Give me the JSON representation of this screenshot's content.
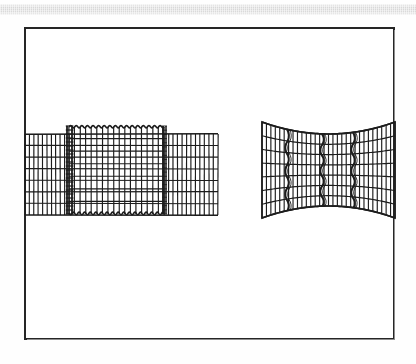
{
  "page": {
    "background_color": "#ffffff",
    "scan_band": {
      "name": "scan-artifact-band",
      "color": "#d4d4d4",
      "x": 0,
      "y": 4,
      "width": 416,
      "height": 11
    },
    "frame": {
      "name": "figure-border",
      "color": "#262626",
      "x": 24,
      "y": 27,
      "width": 371,
      "height": 313,
      "stroke_width": 2
    }
  },
  "figure": {
    "type": "finite-element-mesh-diagram",
    "panel_count": 2,
    "ink_color": "#1c1c1c",
    "caption": "",
    "panels": [
      {
        "name": "left-mesh-undeformed-with-inclusion",
        "label": "",
        "x": 25,
        "y": 126,
        "width": 193,
        "height": 92,
        "description": "Rectangular finite element mesh with an embedded rectangular inclusion bounded by a serrated/scalloped interface and a dense transition strip of small elements on its left edge.",
        "outer_mesh": {
          "left": 25,
          "right": 218,
          "top": 134,
          "bottom": 215,
          "columns": 34,
          "rows": 7
        },
        "inclusion": {
          "left": 69,
          "right": 164,
          "top": 126,
          "bottom": 214,
          "columns": 17,
          "rows": 7,
          "boundary_style": "scalloped",
          "scallop_count_top": 17,
          "scallop_count_bottom": 17
        },
        "interface_strip": {
          "x": 67,
          "width": 5,
          "band_count": 22,
          "description": "dense ladder of very small elements at the inclusion left interface"
        },
        "right_interface": {
          "x": 163,
          "width": 3,
          "description": "thick vertical interface line at the inclusion right edge"
        }
      },
      {
        "name": "right-mesh-deformed-necked",
        "label": "",
        "x": 262,
        "y": 120,
        "width": 133,
        "height": 98,
        "description": "Deformed finite element mesh showing necking: the top and bottom boundaries bow inward toward the centre, with three wavy vertical shear-band interfaces crossing the mesh.",
        "outer_mesh": {
          "left": 262,
          "right": 395,
          "top": 120,
          "bottom": 220,
          "columns": 30,
          "rows": 7
        },
        "neck": {
          "top_edge_y_at_ends": 122,
          "top_edge_y_at_center": 134,
          "bottom_edge_y_at_ends": 218,
          "bottom_edge_y_at_center": 206,
          "shape": "hourglass"
        },
        "shear_bands": [
          {
            "name": "shear-band-left",
            "x": 287,
            "waviness": "zigzag",
            "lobes": 7
          },
          {
            "name": "shear-band-center",
            "x": 322,
            "waviness": "zigzag",
            "lobes": 7
          },
          {
            "name": "shear-band-right",
            "x": 353,
            "waviness": "zigzag",
            "lobes": 7
          }
        ]
      }
    ]
  }
}
